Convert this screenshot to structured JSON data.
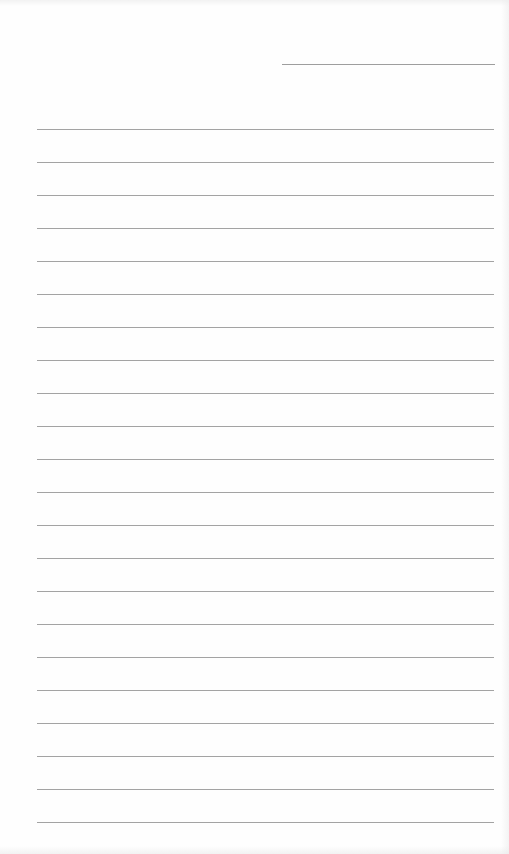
{
  "page": {
    "type": "lined-paper",
    "background_color": "#fefefe",
    "line_color": "#a3a3a3"
  },
  "header_line": {
    "x": 282,
    "y": 64,
    "width": 213
  },
  "ruled_lines": {
    "x": 37,
    "width": 457,
    "first_y": 129,
    "spacing": 33,
    "count": 22
  }
}
